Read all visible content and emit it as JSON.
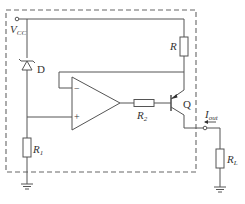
{
  "diagram": {
    "type": "circuit-schematic",
    "labels": {
      "vcc": "V",
      "vcc_sub": "CC",
      "zener": "D",
      "r": "R",
      "r1": "R",
      "r1_sub": "1",
      "r2": "R",
      "r2_sub": "2",
      "q": "Q",
      "iout": "I",
      "iout_sub": "out",
      "rl": "R",
      "rl_sub": "L",
      "opamp_minus": "−",
      "opamp_plus": "+"
    },
    "components": [
      {
        "id": "vcc-terminal",
        "kind": "terminal"
      },
      {
        "id": "D",
        "kind": "zener-diode"
      },
      {
        "id": "R",
        "kind": "resistor"
      },
      {
        "id": "R1",
        "kind": "resistor"
      },
      {
        "id": "R2",
        "kind": "resistor"
      },
      {
        "id": "opamp",
        "kind": "operational-amplifier"
      },
      {
        "id": "Q",
        "kind": "pnp-transistor"
      },
      {
        "id": "RL",
        "kind": "resistor"
      },
      {
        "id": "ground-1",
        "kind": "ground"
      },
      {
        "id": "ground-2",
        "kind": "ground"
      },
      {
        "id": "output-terminal",
        "kind": "terminal"
      }
    ],
    "colors": {
      "line": "#555555",
      "text": "#333333",
      "background": "#ffffff"
    }
  }
}
